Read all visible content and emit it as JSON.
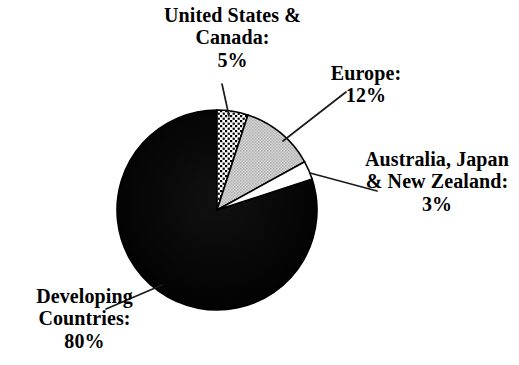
{
  "chart_data": {
    "type": "pie",
    "title": "",
    "subtitle": "",
    "xlabel": "",
    "ylabel": "",
    "legend_position": "none",
    "grid": false,
    "labels_outside": true,
    "start_angle_deg": 0,
    "direction": "clockwise",
    "categories": [
      "United States & Canada",
      "Europe",
      "Australia, Japan & New Zealand",
      "Developing Countries"
    ],
    "values": [
      5,
      12,
      3,
      80
    ],
    "value_suffix": "%",
    "slices": [
      {
        "name": "United States & Canada",
        "value": 5,
        "percent_text": "5%",
        "fill_style": "dotted-pattern",
        "fill_color": "#ffffff",
        "pattern_color": "#000000",
        "start_deg": 0,
        "end_deg": 18
      },
      {
        "name": "Europe",
        "value": 12,
        "percent_text": "12%",
        "fill_style": "gray-stipple",
        "fill_color": "#c8c8c8",
        "pattern_color": "#9a9a9a",
        "start_deg": 18,
        "end_deg": 61.2
      },
      {
        "name": "Australia, Japan & New Zealand",
        "value": 3,
        "percent_text": "3%",
        "fill_style": "solid",
        "fill_color": "#ffffff",
        "pattern_color": "#000000",
        "start_deg": 61.2,
        "end_deg": 72
      },
      {
        "name": "Developing Countries",
        "value": 80,
        "percent_text": "80%",
        "fill_style": "solid",
        "fill_color": "#000000",
        "pattern_color": "#000000",
        "start_deg": 72,
        "end_deg": 360
      }
    ]
  },
  "labels": {
    "us_canada": {
      "line1": "United States &",
      "line2": "Canada:",
      "percent": "5%"
    },
    "europe": {
      "line1": "Europe:",
      "percent": "12%"
    },
    "australia": {
      "line1": "Australia, Japan",
      "line2": "& New Zealand:",
      "percent": "3%"
    },
    "developing": {
      "line1": "Developing",
      "line2": "Countries:",
      "percent": "80%"
    }
  },
  "colors": {
    "background": "#ffffff",
    "text": "#000000",
    "outline": "#000000",
    "slice_black": "#000000",
    "slice_gray": "#c8c8c8",
    "slice_white": "#ffffff",
    "leader_line": "#1a1a1a"
  }
}
